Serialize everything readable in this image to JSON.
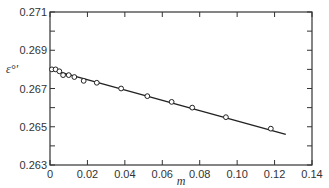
{
  "chart_data": {
    "type": "scatter",
    "title": "",
    "xlabel": "m",
    "ylabel": "ε°'",
    "xlim": [
      0,
      0.14
    ],
    "ylim": [
      0.263,
      0.271
    ],
    "x_ticks": [
      "0",
      "0.02",
      "0.04",
      "0.06",
      "0.08",
      "0.10",
      "0.12",
      "0.14"
    ],
    "y_ticks": [
      "0.263",
      "0.265",
      "0.267",
      "0.269",
      "0.271"
    ],
    "grid": false,
    "legend": null,
    "series": [
      {
        "name": "measured",
        "marker": "open-circle",
        "x": [
          0.001,
          0.003,
          0.005,
          0.007,
          0.01,
          0.013,
          0.018,
          0.025,
          0.038,
          0.052,
          0.065,
          0.076,
          0.094,
          0.118
        ],
        "y": [
          0.268,
          0.268,
          0.2679,
          0.2677,
          0.2677,
          0.2676,
          0.2674,
          0.2673,
          0.267,
          0.2666,
          0.2663,
          0.266,
          0.2655,
          0.2649
        ]
      },
      {
        "name": "fit",
        "marker": "line",
        "x": [
          0,
          0.126
        ],
        "y": [
          0.268,
          0.2646
        ]
      }
    ]
  }
}
